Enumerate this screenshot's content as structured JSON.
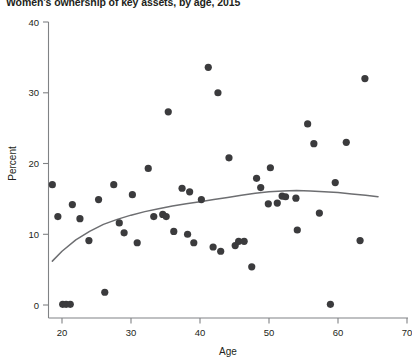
{
  "chart_data": {
    "type": "scatter",
    "title": "Women's ownership of key assets, by age, 2015",
    "xlabel": "Age",
    "ylabel": "Percent",
    "xlim": [
      18,
      70
    ],
    "ylim": [
      0,
      40
    ],
    "xticks": [
      20,
      30,
      40,
      50,
      60,
      70
    ],
    "yticks": [
      0,
      10,
      20,
      30,
      40
    ],
    "grid": false,
    "legend": "none",
    "series": [
      {
        "name": "Women's ownership of key assets",
        "marker": "filled-circle",
        "color": "#3b3b3d",
        "points": [
          [
            18.6,
            17.0
          ],
          [
            19.4,
            12.5
          ],
          [
            20.1,
            0.1
          ],
          [
            20.6,
            0.1
          ],
          [
            21.2,
            0.1
          ],
          [
            21.5,
            14.2
          ],
          [
            22.6,
            12.2
          ],
          [
            23.9,
            9.1
          ],
          [
            25.3,
            14.9
          ],
          [
            26.2,
            1.8
          ],
          [
            27.5,
            17.0
          ],
          [
            28.3,
            11.6
          ],
          [
            29.0,
            10.2
          ],
          [
            30.2,
            15.6
          ],
          [
            30.9,
            8.8
          ],
          [
            32.5,
            19.3
          ],
          [
            33.3,
            12.5
          ],
          [
            34.6,
            12.8
          ],
          [
            35.1,
            12.5
          ],
          [
            35.4,
            27.3
          ],
          [
            36.2,
            10.4
          ],
          [
            37.4,
            16.5
          ],
          [
            38.2,
            10.0
          ],
          [
            38.5,
            16.0
          ],
          [
            39.1,
            8.8
          ],
          [
            40.2,
            14.9
          ],
          [
            41.2,
            33.6
          ],
          [
            41.9,
            8.2
          ],
          [
            42.6,
            30.0
          ],
          [
            43.0,
            7.6
          ],
          [
            44.2,
            20.8
          ],
          [
            45.1,
            8.4
          ],
          [
            45.6,
            9.0
          ],
          [
            46.4,
            9.0
          ],
          [
            47.5,
            5.4
          ],
          [
            48.2,
            17.9
          ],
          [
            48.8,
            16.6
          ],
          [
            49.9,
            14.3
          ],
          [
            50.2,
            19.4
          ],
          [
            51.2,
            14.4
          ],
          [
            51.9,
            15.4
          ],
          [
            52.4,
            15.3
          ],
          [
            53.9,
            15.1
          ],
          [
            54.1,
            10.6
          ],
          [
            55.6,
            25.6
          ],
          [
            56.5,
            22.8
          ],
          [
            57.3,
            13.0
          ],
          [
            58.9,
            0.1
          ],
          [
            59.6,
            17.3
          ],
          [
            61.2,
            23.0
          ],
          [
            63.2,
            9.1
          ],
          [
            63.9,
            32.0
          ]
        ]
      }
    ],
    "trendline": {
      "name": "fitted trend",
      "color": "#6d6e71",
      "points": [
        [
          18.6,
          6.2
        ],
        [
          20.0,
          7.6
        ],
        [
          22.0,
          9.2
        ],
        [
          24.0,
          10.4
        ],
        [
          26.0,
          11.4
        ],
        [
          28.0,
          12.1
        ],
        [
          30.0,
          12.7
        ],
        [
          32.0,
          13.2
        ],
        [
          34.0,
          13.6
        ],
        [
          36.0,
          14.0
        ],
        [
          38.0,
          14.3
        ],
        [
          40.0,
          14.6
        ],
        [
          42.0,
          14.9
        ],
        [
          44.0,
          15.2
        ],
        [
          46.0,
          15.5
        ],
        [
          48.0,
          15.8
        ],
        [
          50.0,
          16.0
        ],
        [
          52.0,
          16.1
        ],
        [
          54.0,
          16.2
        ],
        [
          56.0,
          16.1
        ],
        [
          58.0,
          16.0
        ],
        [
          60.0,
          15.9
        ],
        [
          62.0,
          15.7
        ],
        [
          64.0,
          15.5
        ],
        [
          65.8,
          15.3
        ]
      ]
    }
  }
}
